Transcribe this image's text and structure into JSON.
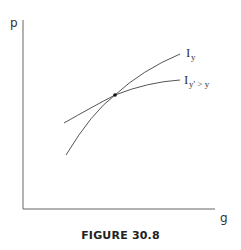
{
  "figure": {
    "caption": "FIGURE 30.8",
    "axes": {
      "y_label": "p",
      "x_label": "g"
    },
    "curves": [
      {
        "name": "I_y",
        "label_main": "I",
        "label_sub": "y"
      },
      {
        "name": "I_y'>y",
        "label_main": "I",
        "label_sub": "y' > y"
      }
    ],
    "intersection_point": "tangency/crossing point of the two indifference curves",
    "colors": {
      "lines": "#555555",
      "text": "#333333",
      "point": "#111111"
    }
  }
}
